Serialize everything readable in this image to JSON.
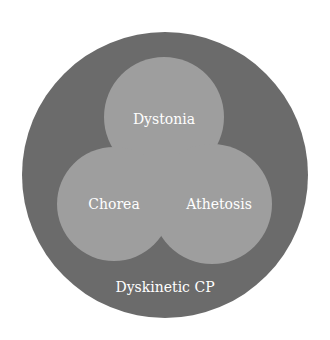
{
  "diagram": {
    "type": "venn",
    "outer": {
      "label": "Dyskinetic CP",
      "color": "#6b6b6b"
    },
    "sets": [
      {
        "label": "Dystonia"
      },
      {
        "label": "Chorea"
      },
      {
        "label": "Athetosis"
      }
    ],
    "colors": {
      "outer": "#6b6b6b",
      "circle": "#9a9a9a",
      "text": "#ffffff"
    }
  }
}
